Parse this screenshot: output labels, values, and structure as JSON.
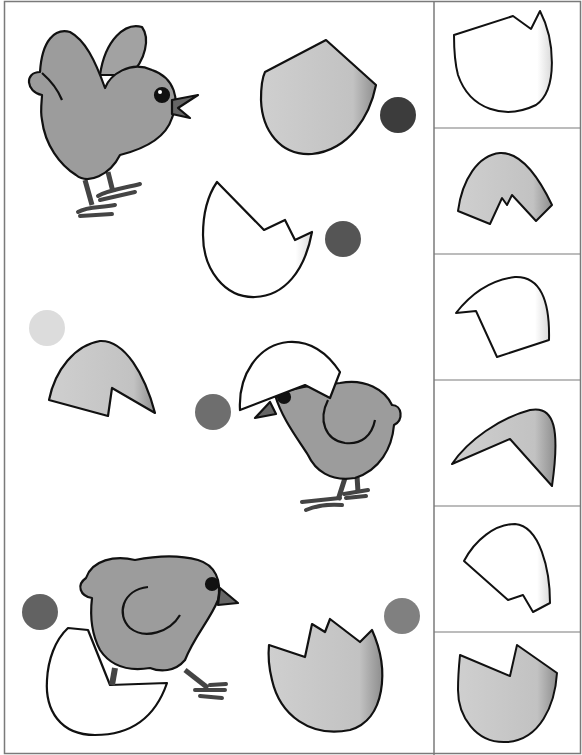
{
  "worksheet": {
    "type": "cut-and-match activity",
    "main_panel": {
      "scenes": [
        {
          "id": "chick-standing",
          "kind": "chick"
        },
        {
          "id": "shell-gray-cap",
          "kind": "shell",
          "fill": "#c4c4c4",
          "dot_color": "#3c3c3c"
        },
        {
          "id": "shell-white-bottom",
          "kind": "shell",
          "fill": "#ffffff",
          "dot_color": "#555555"
        },
        {
          "id": "shell-gray-top",
          "kind": "shell",
          "fill": "#c8c8c8",
          "dot_color": "#dcdcdc"
        },
        {
          "id": "chick-with-shell-hat",
          "kind": "chick",
          "dot_color": "#6e6e6e"
        },
        {
          "id": "chick-in-shell",
          "kind": "chick",
          "dot_color": "#626262"
        },
        {
          "id": "shell-gray-crown",
          "kind": "shell",
          "fill": "#c4c4c4",
          "dot_color": "#808080"
        }
      ]
    },
    "cutout_column": {
      "pieces": [
        {
          "index": 1,
          "fill": "#ffffff"
        },
        {
          "index": 2,
          "fill": "#bcbcbc"
        },
        {
          "index": 3,
          "fill": "#ffffff"
        },
        {
          "index": 4,
          "fill": "#c4c4c4"
        },
        {
          "index": 5,
          "fill": "#ffffff"
        },
        {
          "index": 6,
          "fill": "#bdbdbd"
        }
      ]
    },
    "colors": {
      "chick_body": "#9c9c9c",
      "chick_legs": "#555555",
      "outline": "#111111",
      "border": "#7a7a7a"
    }
  }
}
